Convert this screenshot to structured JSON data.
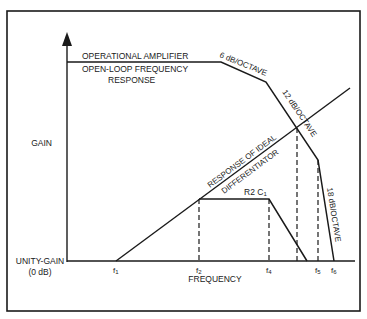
{
  "diagram": {
    "y_axis_label": "GAIN",
    "x_axis_label": "FREQUENCY",
    "baseline_label_line1": "UNITY-GAIN",
    "baseline_label_line2": "(0 dB)",
    "open_loop_label_line1": "OPERATIONAL AMPLIFIER",
    "open_loop_label_line2": "OPEN-LOOP FREQUENCY",
    "open_loop_label_line3": "RESPONSE",
    "slope_6": "6 dB/OCTAVE",
    "slope_12": "12 dB/OCTAVE",
    "slope_18": "18 dB/OCTAVE",
    "ideal_label_line1": "RESPONSE OF IDEAL",
    "ideal_label_line2": "DIFFERENTIATOR",
    "plateau_label_main": "R2 C",
    "plateau_label_sub": "1",
    "freq_ticks": [
      {
        "label": "f",
        "sub": "1"
      },
      {
        "label": "f",
        "sub": "2"
      },
      {
        "label": "f",
        "sub": "4"
      },
      {
        "label": "f",
        "sub": "5"
      },
      {
        "label": "f",
        "sub": "6"
      }
    ],
    "colors": {
      "line": "#1a1a1a",
      "background": "#ffffff"
    }
  }
}
